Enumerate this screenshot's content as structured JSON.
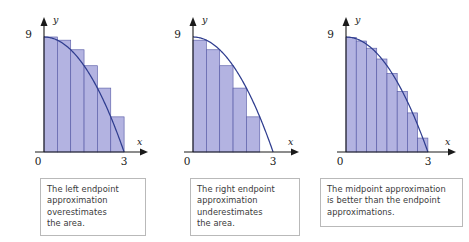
{
  "figure": {
    "colors": {
      "rect_fill": "#a8a9dd",
      "rect_stroke": "#5b5ea8",
      "curve": "#2f3d8f",
      "axis": "#1a1a1a",
      "caption_border": "#b9b9b9",
      "caption_text": "#3a3a3a",
      "background": "#ffffff"
    }
  },
  "chart_data": [
    {
      "type": "bar",
      "title": "Left endpoint approximation",
      "method": "left-endpoint",
      "function": "y = 9 - x^2",
      "xlabel": "x",
      "ylabel": "y",
      "xlim": [
        0,
        3
      ],
      "ylim": [
        0,
        9
      ],
      "xticks": [
        0,
        3
      ],
      "xtick_labels": [
        "0",
        "3"
      ],
      "yticks": [
        9
      ],
      "ytick_labels": [
        "9"
      ],
      "grid": false,
      "legend": "none",
      "n_rectangles": 6,
      "rect_width": 0.5,
      "x_left_edges": [
        0,
        0.5,
        1.0,
        1.5,
        2.0,
        2.5
      ],
      "sample_points": [
        0,
        0.5,
        1.0,
        1.5,
        2.0,
        2.5
      ],
      "values": [
        9,
        8.75,
        8,
        6.75,
        5,
        2.75
      ],
      "curve_points_x": [
        0,
        0.25,
        0.5,
        0.75,
        1,
        1.25,
        1.5,
        1.75,
        2,
        2.25,
        2.5,
        2.75,
        3
      ],
      "curve_points_y": [
        9,
        8.9375,
        8.75,
        8.4375,
        8,
        7.4375,
        6.75,
        5.9375,
        5,
        3.9375,
        2.75,
        1.4375,
        0
      ]
    },
    {
      "type": "bar",
      "title": "Right endpoint approximation",
      "method": "right-endpoint",
      "function": "y = 9 - x^2",
      "xlabel": "x",
      "ylabel": "y",
      "xlim": [
        0,
        3
      ],
      "ylim": [
        0,
        9
      ],
      "xticks": [
        0,
        3
      ],
      "xtick_labels": [
        "0",
        "3"
      ],
      "yticks": [
        9
      ],
      "ytick_labels": [
        "9"
      ],
      "grid": false,
      "legend": "none",
      "n_rectangles": 6,
      "rect_width": 0.5,
      "x_left_edges": [
        0,
        0.5,
        1.0,
        1.5,
        2.0,
        2.5
      ],
      "sample_points": [
        0.5,
        1.0,
        1.5,
        2.0,
        2.5,
        3.0
      ],
      "values": [
        8.75,
        8,
        6.75,
        5,
        2.75,
        0
      ],
      "curve_points_x": [
        0,
        0.25,
        0.5,
        0.75,
        1,
        1.25,
        1.5,
        1.75,
        2,
        2.25,
        2.5,
        2.75,
        3
      ],
      "curve_points_y": [
        9,
        8.9375,
        8.75,
        8.4375,
        8,
        7.4375,
        6.75,
        5.9375,
        5,
        3.9375,
        2.75,
        1.4375,
        0
      ]
    },
    {
      "type": "bar",
      "title": "Midpoint approximation",
      "method": "midpoint",
      "function": "y = 9 - x^2",
      "xlabel": "x",
      "ylabel": "y",
      "xlim": [
        0,
        3
      ],
      "ylim": [
        0,
        9
      ],
      "xticks": [
        0,
        3
      ],
      "xtick_labels": [
        "0",
        "3"
      ],
      "yticks": [
        9
      ],
      "ytick_labels": [
        "9"
      ],
      "grid": false,
      "legend": "none",
      "n_rectangles": 8,
      "rect_width": 0.375,
      "x_left_edges": [
        0,
        0.375,
        0.75,
        1.125,
        1.5,
        1.875,
        2.25,
        2.625
      ],
      "sample_points": [
        0.1875,
        0.5625,
        0.9375,
        1.3125,
        1.6875,
        2.0625,
        2.4375,
        2.8125
      ],
      "values": [
        8.965,
        8.684,
        8.121,
        7.277,
        6.152,
        4.746,
        3.059,
        1.09
      ],
      "curve_points_x": [
        0,
        0.25,
        0.5,
        0.75,
        1,
        1.25,
        1.5,
        1.75,
        2,
        2.25,
        2.5,
        2.75,
        3
      ],
      "curve_points_y": [
        9,
        8.9375,
        8.75,
        8.4375,
        8,
        7.4375,
        6.75,
        5.9375,
        5,
        3.9375,
        2.75,
        1.4375,
        0
      ]
    }
  ],
  "captions": [
    {
      "id": "left-endpoint-caption",
      "lines": [
        "The left endpoint",
        "approximation",
        "overestimates",
        "the area."
      ]
    },
    {
      "id": "right-endpoint-caption",
      "lines": [
        "The right endpoint",
        "approximation",
        "underestimates",
        "the area."
      ]
    },
    {
      "id": "midpoint-caption",
      "lines": [
        "The midpoint approximation",
        "is better than the endpoint",
        "approximations."
      ]
    }
  ]
}
